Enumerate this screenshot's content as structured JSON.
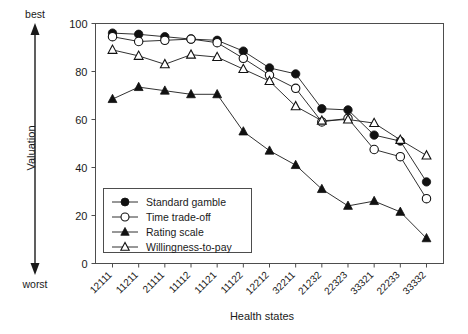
{
  "chart_data": {
    "type": "line",
    "title": "",
    "xlabel": "Health states",
    "ylabel": "Valuation",
    "ylim": [
      0,
      100
    ],
    "yticks": [
      0,
      20,
      40,
      60,
      80,
      100
    ],
    "grid": false,
    "legend_position": "lower-left-inside",
    "axis_anchor_top": "best",
    "axis_anchor_bottom": "worst",
    "categories": [
      "12111",
      "11211",
      "21111",
      "11112",
      "11121",
      "11122",
      "12212",
      "32211",
      "21232",
      "22323",
      "33321",
      "22233",
      "33332"
    ],
    "series": [
      {
        "name": "Standard gamble",
        "marker": "filled-circle",
        "values": [
          96,
          95.5,
          94.5,
          93.5,
          93,
          88.5,
          81.5,
          79,
          64.5,
          64,
          53.5,
          51,
          34
        ]
      },
      {
        "name": "Time trade-off",
        "marker": "open-circle",
        "values": [
          94.5,
          92.5,
          93,
          93.5,
          92,
          85.5,
          78.5,
          73,
          59,
          60.5,
          47.5,
          44.5,
          27
        ]
      },
      {
        "name": "Rating scale",
        "marker": "filled-triangle",
        "values": [
          68.5,
          73.5,
          72,
          70.5,
          70.5,
          55,
          47,
          41,
          31,
          24,
          26,
          21.5,
          10.5
        ]
      },
      {
        "name": "Willingness-to-pay",
        "marker": "open-triangle",
        "values": [
          89,
          86.5,
          83,
          87,
          86,
          81,
          76,
          65.5,
          59.5,
          60,
          58.5,
          51.5,
          45
        ]
      }
    ]
  },
  "legend": {
    "entries": [
      {
        "label": "Standard gamble"
      },
      {
        "label": "Time trade-off"
      },
      {
        "label": "Rating scale"
      },
      {
        "label": "Willingness-to-pay"
      }
    ]
  },
  "axes": {
    "y_title": "Valuation",
    "x_title": "Health states",
    "top_anchor": "best",
    "bottom_anchor": "worst",
    "y_tick_labels": [
      "0",
      "20",
      "40",
      "60",
      "80",
      "100"
    ]
  }
}
